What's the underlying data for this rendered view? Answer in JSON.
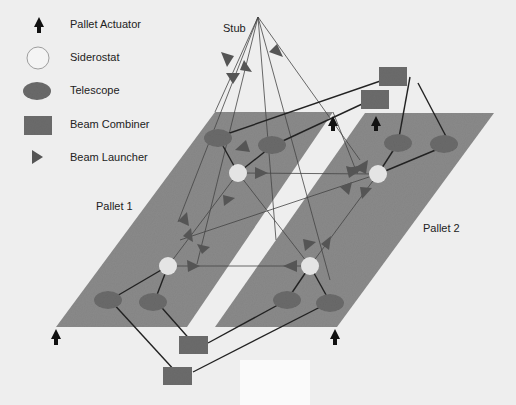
{
  "legend": {
    "items": [
      {
        "icon": "pallet-actuator-icon",
        "label": "Pallet Actuator"
      },
      {
        "icon": "siderostat-icon",
        "label": "Siderostat"
      },
      {
        "icon": "telescope-icon",
        "label": "Telescope"
      },
      {
        "icon": "beam-combiner-icon",
        "label": "Beam Combiner"
      },
      {
        "icon": "beam-launcher-icon",
        "label": "Beam Launcher"
      }
    ]
  },
  "labels": {
    "stub": "Stub",
    "pallet1": "Pallet 1",
    "pallet2": "Pallet 2"
  },
  "colors": {
    "background": "#eeeeee",
    "pallet": "#8a8a8a",
    "telescope": "#6a6a6a",
    "combiner": "#6c6c6c",
    "launcher": "#5a5a5a",
    "siderostat": "#e4e4e4",
    "line": "#333333",
    "actuator": "#111111"
  }
}
